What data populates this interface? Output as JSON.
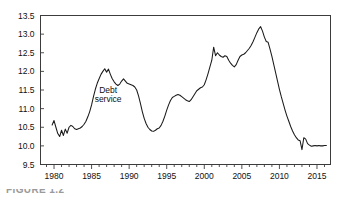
{
  "figure": {
    "caption_fragment": "FIGURE 1.2"
  },
  "chart_data": {
    "type": "line",
    "title": "",
    "subtitle": "",
    "xlabel": "",
    "ylabel": "",
    "xlim": [
      1978.2,
      2016.8
    ],
    "ylim": [
      9.5,
      13.5
    ],
    "grid": false,
    "legend_position": "none",
    "annotations": [
      {
        "text_line_1": "Debt",
        "text_line_2": "service",
        "x": 1987.2,
        "y": 11.42
      }
    ],
    "yticks": [
      9.5,
      10.0,
      10.5,
      11.0,
      11.5,
      12.0,
      12.5,
      13.0,
      13.5
    ],
    "ytick_labels": [
      "9.5",
      "10.0",
      "10.5",
      "11.0",
      "11.5",
      "12.0",
      "12.5",
      "13.0",
      "13.5"
    ],
    "xticks_major": [
      1980,
      1985,
      1990,
      1995,
      2000,
      2005,
      2010,
      2015
    ],
    "xtick_labels": [
      "1980",
      "1985",
      "1990",
      "1995",
      "2000",
      "2005",
      "2010",
      "2015"
    ],
    "xticks_minor_step": 1,
    "xticks_minor_range": [
      1979,
      2016
    ],
    "series": [
      {
        "name": "Debt service",
        "color": "#1a1a1a",
        "x": [
          1979.75,
          1980.0,
          1980.25,
          1980.5,
          1980.75,
          1981.0,
          1981.25,
          1981.5,
          1981.75,
          1982.0,
          1982.25,
          1982.5,
          1982.75,
          1983.0,
          1983.25,
          1983.5,
          1983.75,
          1984.0,
          1984.25,
          1984.5,
          1984.75,
          1985.0,
          1985.25,
          1985.5,
          1985.75,
          1986.0,
          1986.25,
          1986.5,
          1986.75,
          1987.0,
          1987.25,
          1987.5,
          1987.75,
          1988.0,
          1988.25,
          1988.5,
          1988.75,
          1989.0,
          1989.25,
          1989.5,
          1989.75,
          1990.0,
          1990.25,
          1990.5,
          1990.75,
          1991.0,
          1991.25,
          1991.5,
          1991.75,
          1992.0,
          1992.25,
          1992.5,
          1992.75,
          1993.0,
          1993.25,
          1993.5,
          1993.75,
          1994.0,
          1994.25,
          1994.5,
          1994.75,
          1995.0,
          1995.25,
          1995.5,
          1995.75,
          1996.0,
          1996.25,
          1996.5,
          1996.75,
          1997.0,
          1997.25,
          1997.5,
          1997.75,
          1998.0,
          1998.25,
          1998.5,
          1998.75,
          1999.0,
          1999.25,
          1999.5,
          1999.75,
          2000.0,
          2000.25,
          2000.5,
          2000.75,
          2001.0,
          2001.25,
          2001.5,
          2001.75,
          2002.0,
          2002.25,
          2002.5,
          2002.75,
          2003.0,
          2003.25,
          2003.5,
          2003.75,
          2004.0,
          2004.25,
          2004.5,
          2004.75,
          2005.0,
          2005.25,
          2005.5,
          2005.75,
          2006.0,
          2006.25,
          2006.5,
          2006.75,
          2007.0,
          2007.25,
          2007.5,
          2007.75,
          2008.0,
          2008.25,
          2008.5,
          2008.75,
          2009.0,
          2009.25,
          2009.5,
          2009.75,
          2010.0,
          2010.25,
          2010.5,
          2010.75,
          2011.0,
          2011.25,
          2011.5,
          2011.75,
          2012.0,
          2012.25,
          2012.5,
          2012.75,
          2013.0,
          2013.25,
          2013.5,
          2013.75,
          2014.0,
          2014.25,
          2014.5,
          2014.75,
          2015.0,
          2015.25,
          2015.5,
          2015.75,
          2016.0,
          2016.25
        ],
        "y": [
          10.56,
          10.68,
          10.5,
          10.33,
          10.25,
          10.42,
          10.28,
          10.45,
          10.34,
          10.5,
          10.55,
          10.52,
          10.46,
          10.44,
          10.46,
          10.48,
          10.52,
          10.58,
          10.66,
          10.78,
          10.92,
          11.1,
          11.32,
          11.52,
          11.68,
          11.8,
          11.92,
          12.0,
          12.07,
          11.98,
          12.06,
          11.92,
          11.8,
          11.72,
          11.66,
          11.62,
          11.66,
          11.74,
          11.8,
          11.74,
          11.68,
          11.66,
          11.64,
          11.62,
          11.58,
          11.5,
          11.34,
          11.14,
          10.92,
          10.74,
          10.6,
          10.5,
          10.44,
          10.4,
          10.39,
          10.42,
          10.46,
          10.48,
          10.55,
          10.66,
          10.8,
          10.96,
          11.1,
          11.22,
          11.3,
          11.33,
          11.36,
          11.38,
          11.36,
          11.32,
          11.28,
          11.24,
          11.21,
          11.19,
          11.24,
          11.32,
          11.4,
          11.48,
          11.52,
          11.56,
          11.58,
          11.64,
          11.78,
          11.94,
          12.12,
          12.3,
          12.65,
          12.42,
          12.5,
          12.44,
          12.4,
          12.38,
          12.42,
          12.4,
          12.3,
          12.22,
          12.16,
          12.12,
          12.18,
          12.3,
          12.4,
          12.44,
          12.46,
          12.5,
          12.56,
          12.62,
          12.7,
          12.8,
          12.92,
          13.04,
          13.14,
          13.2,
          13.08,
          12.92,
          12.8,
          12.78,
          12.6,
          12.4,
          12.18,
          11.96,
          11.74,
          11.52,
          11.32,
          11.14,
          10.96,
          10.8,
          10.66,
          10.52,
          10.4,
          10.3,
          10.22,
          10.16,
          10.14,
          9.9,
          10.22,
          10.18,
          10.06,
          10.02,
          9.99,
          10.0,
          10.01,
          10.0,
          10.01,
          10.0,
          10.0,
          10.01,
          10.01
        ]
      }
    ]
  }
}
